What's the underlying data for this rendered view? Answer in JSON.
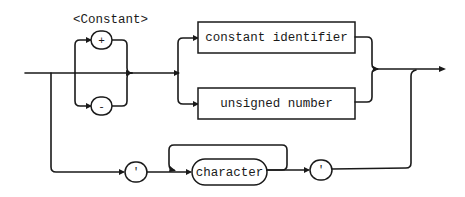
{
  "diagram": {
    "title": "<Constant>",
    "type": "syntax-diagram",
    "nodes": {
      "plus": "+",
      "minus": "-",
      "constant_identifier": "constant identifier",
      "unsigned_number": "unsigned number",
      "quote_open": "'",
      "character": "character",
      "quote_close": "'"
    },
    "colors": {
      "ink": "#1a1a1a",
      "background": "#ffffff"
    }
  }
}
